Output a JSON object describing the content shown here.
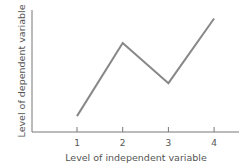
{
  "chart_data": {
    "type": "line",
    "title": "",
    "xlabel": "Level of  independent variable",
    "ylabel": "Level of  dependent variable",
    "categories": [
      "1",
      "2",
      "3",
      "4"
    ],
    "x": [
      1,
      2,
      3,
      4
    ],
    "values": [
      1.3,
      7.3,
      4.0,
      9.3
    ],
    "ylim": [
      0,
      10
    ],
    "y_ticks_shown": false,
    "grid": false,
    "legend": null,
    "line_color": "#888888",
    "axis_color": "#777777"
  }
}
